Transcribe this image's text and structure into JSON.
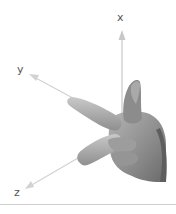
{
  "diagram": {
    "axes": [
      {
        "name": "x",
        "label": "x",
        "direction": "up (thumb)"
      },
      {
        "name": "y",
        "label": "y",
        "direction": "upper-left (index finger)"
      },
      {
        "name": "z",
        "label": "z",
        "direction": "lower-left (middle finger)"
      }
    ],
    "colors": {
      "axis_line": "#c8c8c8",
      "label_text": "#555555",
      "hand_dark": "#6e6e6e",
      "hand_mid": "#9a9a9a",
      "hand_light": "#c4c4c4",
      "divider": "#cfcfcf"
    }
  }
}
